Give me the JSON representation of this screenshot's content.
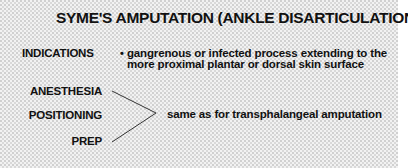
{
  "title": "SYME'S AMPUTATION (ANKLE DISARTICULATION)",
  "indications": {
    "label": "INDICATIONS",
    "bullet": "•",
    "lines": [
      "gangrenous or infected process extending to the",
      "more proximal plantar or dorsal skin surface"
    ]
  },
  "grouped": {
    "labels": [
      "ANESTHESIA",
      "POSITIONING",
      "PREP"
    ],
    "shared_text": "same as for transphalangeal amputation"
  },
  "colors": {
    "text": "#111111",
    "background_stipple": "#f2f2f2"
  }
}
